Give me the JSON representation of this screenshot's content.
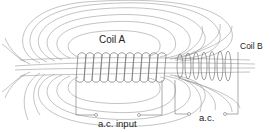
{
  "diagram": {
    "labels": {
      "coil_a": "Coil A",
      "coil_b": "Coil B",
      "ac_input": "a.c. input",
      "ac_output": "a.c."
    },
    "colors": {
      "field_lines": "#9a9a9a",
      "coil_windings": "#777777",
      "wires": "#888888",
      "text": "#222222",
      "background": "#ffffff"
    },
    "components": [
      {
        "id": "coil-a",
        "type": "solenoid",
        "role": "primary"
      },
      {
        "id": "coil-b",
        "type": "solenoid",
        "role": "secondary"
      },
      {
        "id": "ac-input-terminals",
        "type": "terminal-pair"
      },
      {
        "id": "ac-output-terminals",
        "type": "terminal-pair"
      },
      {
        "id": "magnetic-field-lines",
        "type": "field-lines"
      }
    ]
  }
}
